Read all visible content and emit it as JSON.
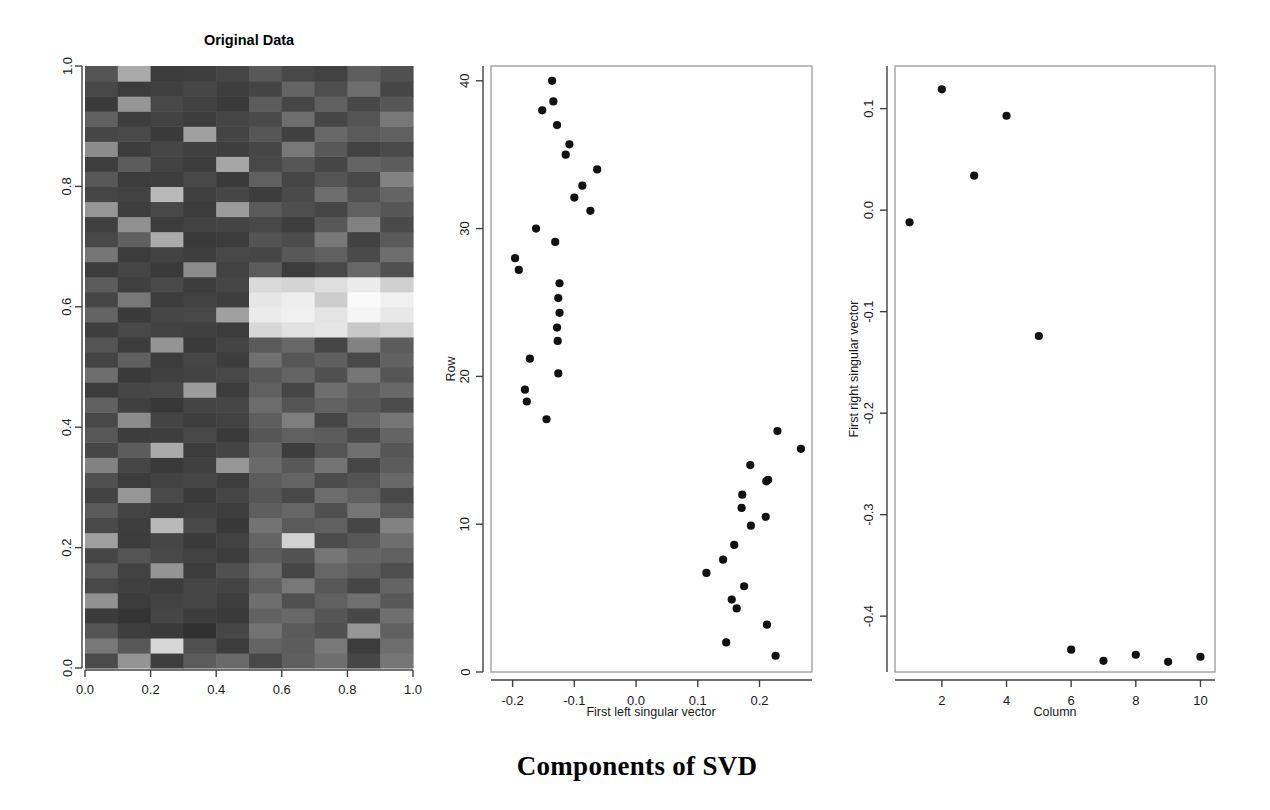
{
  "main_title": "Components of SVD",
  "panels": {
    "heatmap": {
      "title": "Original Data",
      "x_ticks": [
        "0.0",
        "0.2",
        "0.4",
        "0.6",
        "0.8",
        "1.0"
      ],
      "y_ticks": [
        "0.0",
        "0.2",
        "0.4",
        "0.6",
        "0.8",
        "1.0"
      ],
      "xlabel": "",
      "ylabel": ""
    },
    "left_vector": {
      "xlabel": "First left singular vector",
      "ylabel": "Row",
      "x_ticks": [
        "-0.2",
        "-0.1",
        "0.0",
        "0.1",
        "0.2"
      ],
      "y_ticks": [
        "0",
        "10",
        "20",
        "30",
        "40"
      ]
    },
    "right_vector": {
      "xlabel": "Column",
      "ylabel": "First right singular vector",
      "x_ticks": [
        "2",
        "4",
        "6",
        "8",
        "10"
      ],
      "y_ticks": [
        "-0.4",
        "-0.3",
        "-0.2",
        "-0.1",
        "0.0",
        "0.1"
      ]
    }
  },
  "colors": {
    "point": "#111111",
    "axis": "#404040",
    "box": "#9a9a9a",
    "background": "#ffffff"
  },
  "chart_data": [
    {
      "type": "heatmap",
      "title": "Original Data",
      "xlabel": "",
      "ylabel": "",
      "xlim": [
        0.0,
        1.0
      ],
      "ylim": [
        0.0,
        1.0
      ],
      "grid": false,
      "legend": "none",
      "ncols": 10,
      "nrows": 40,
      "colormap": "grayscale",
      "xtick_values": [
        0.0,
        0.2,
        0.4,
        0.6,
        0.8,
        1.0
      ],
      "ytick_values": [
        0.0,
        0.2,
        0.4,
        0.6,
        0.8,
        1.0
      ],
      "note": "Rows 1-40 (bottom to top), columns 1-10. Values are grayscale levels 0-255.",
      "matrix": [
        [
          75,
          148,
          62,
          92,
          105,
          72,
          95,
          110,
          70,
          118
        ],
        [
          120,
          88,
          215,
          80,
          60,
          100,
          92,
          120,
          60,
          110
        ],
        [
          84,
          62,
          58,
          48,
          70,
          115,
          90,
          80,
          150,
          96
        ],
        [
          60,
          52,
          70,
          62,
          58,
          98,
          104,
          86,
          72,
          112
        ],
        [
          145,
          60,
          66,
          70,
          62,
          110,
          80,
          96,
          112,
          88
        ],
        [
          72,
          64,
          60,
          70,
          68,
          95,
          120,
          88,
          70,
          100
        ],
        [
          92,
          66,
          148,
          60,
          80,
          108,
          70,
          102,
          92,
          78
        ],
        [
          70,
          84,
          72,
          66,
          60,
          92,
          82,
          118,
          100,
          96
        ],
        [
          160,
          60,
          70,
          58,
          66,
          100,
          210,
          75,
          88,
          110
        ],
        [
          74,
          62,
          185,
          72,
          56,
          115,
          90,
          96,
          70,
          130
        ],
        [
          90,
          68,
          60,
          64,
          62,
          94,
          102,
          80,
          118,
          90
        ],
        [
          66,
          150,
          74,
          58,
          70,
          86,
          72,
          108,
          96,
          72
        ],
        [
          80,
          60,
          66,
          70,
          62,
          92,
          100,
          76,
          84,
          104
        ],
        [
          130,
          70,
          58,
          64,
          150,
          106,
          88,
          116,
          70,
          92
        ],
        [
          70,
          92,
          170,
          60,
          68,
          98,
          60,
          84,
          112,
          86
        ],
        [
          88,
          60,
          62,
          72,
          58,
          86,
          96,
          92,
          74,
          100
        ],
        [
          72,
          140,
          68,
          62,
          66,
          94,
          126,
          70,
          100,
          118
        ],
        [
          96,
          64,
          56,
          68,
          70,
          108,
          84,
          98,
          88,
          76
        ],
        [
          60,
          70,
          72,
          155,
          60,
          96,
          70,
          110,
          92,
          104
        ],
        [
          110,
          58,
          64,
          66,
          72,
          88,
          100,
          80,
          118,
          86
        ],
        [
          68,
          96,
          60,
          70,
          62,
          112,
          86,
          96,
          72,
          98
        ],
        [
          84,
          60,
          148,
          58,
          68,
          90,
          104,
          70,
          130,
          92
        ],
        [
          62,
          72,
          66,
          64,
          60,
          215,
          225,
          230,
          200,
          210
        ],
        [
          100,
          58,
          70,
          72,
          160,
          235,
          240,
          228,
          245,
          232
        ],
        [
          70,
          120,
          60,
          66,
          62,
          230,
          238,
          205,
          250,
          240
        ],
        [
          92,
          64,
          74,
          60,
          70,
          218,
          212,
          222,
          235,
          208
        ],
        [
          60,
          70,
          58,
          140,
          66,
          92,
          60,
          72,
          104,
          80
        ],
        [
          118,
          60,
          66,
          62,
          72,
          70,
          88,
          96,
          74,
          110
        ],
        [
          72,
          96,
          170,
          58,
          60,
          84,
          76,
          120,
          66,
          90
        ],
        [
          64,
          145,
          60,
          66,
          68,
          72,
          62,
          88,
          130,
          74
        ],
        [
          150,
          62,
          72,
          60,
          155,
          90,
          78,
          70,
          96,
          86
        ],
        [
          70,
          66,
          185,
          64,
          70,
          60,
          74,
          110,
          82,
          100
        ],
        [
          88,
          60,
          62,
          72,
          58,
          96,
          70,
          84,
          72,
          130
        ],
        [
          62,
          92,
          66,
          60,
          165,
          72,
          86,
          70,
          100,
          92
        ],
        [
          140,
          60,
          70,
          64,
          62,
          70,
          120,
          88,
          66,
          74
        ],
        [
          70,
          74,
          58,
          160,
          68,
          86,
          64,
          104,
          90,
          96
        ],
        [
          96,
          62,
          66,
          60,
          70,
          74,
          110,
          70,
          84,
          120
        ],
        [
          60,
          150,
          72,
          66,
          58,
          92,
          70,
          96,
          72,
          86
        ],
        [
          72,
          60,
          64,
          70,
          62,
          68,
          100,
          78,
          110,
          70
        ],
        [
          84,
          170,
          60,
          62,
          70,
          88,
          72,
          66,
          94,
          80
        ]
      ]
    },
    {
      "type": "scatter",
      "title": "",
      "xlabel": "First left singular vector",
      "ylabel": "Row",
      "xlim": [
        -0.235,
        0.285
      ],
      "ylim": [
        0,
        41
      ],
      "grid": false,
      "legend": "none",
      "xtick_values": [
        -0.2,
        -0.1,
        0.0,
        0.1,
        0.2
      ],
      "ytick_values": [
        0,
        10,
        20,
        30,
        40
      ],
      "points": [
        {
          "x": -0.136,
          "y": 40.0
        },
        {
          "x": -0.134,
          "y": 38.6
        },
        {
          "x": -0.152,
          "y": 38.0
        },
        {
          "x": -0.128,
          "y": 37.0
        },
        {
          "x": -0.108,
          "y": 35.7
        },
        {
          "x": -0.114,
          "y": 35.0
        },
        {
          "x": -0.063,
          "y": 34.0
        },
        {
          "x": -0.087,
          "y": 32.9
        },
        {
          "x": -0.1,
          "y": 32.1
        },
        {
          "x": -0.074,
          "y": 31.2
        },
        {
          "x": -0.162,
          "y": 30.0
        },
        {
          "x": -0.131,
          "y": 29.1
        },
        {
          "x": -0.196,
          "y": 28.0
        },
        {
          "x": -0.19,
          "y": 27.2
        },
        {
          "x": -0.124,
          "y": 26.3
        },
        {
          "x": -0.126,
          "y": 25.3
        },
        {
          "x": -0.124,
          "y": 24.3
        },
        {
          "x": -0.128,
          "y": 23.3
        },
        {
          "x": -0.127,
          "y": 22.4
        },
        {
          "x": -0.172,
          "y": 21.2
        },
        {
          "x": -0.126,
          "y": 20.2
        },
        {
          "x": -0.18,
          "y": 19.1
        },
        {
          "x": -0.177,
          "y": 18.3
        },
        {
          "x": -0.145,
          "y": 17.1
        },
        {
          "x": 0.229,
          "y": 16.3
        },
        {
          "x": 0.267,
          "y": 15.1
        },
        {
          "x": 0.185,
          "y": 14.0
        },
        {
          "x": 0.211,
          "y": 12.9
        },
        {
          "x": 0.172,
          "y": 12.0
        },
        {
          "x": 0.171,
          "y": 11.1
        },
        {
          "x": 0.21,
          "y": 10.5
        },
        {
          "x": 0.214,
          "y": 13.0
        },
        {
          "x": 0.186,
          "y": 9.9
        },
        {
          "x": 0.159,
          "y": 8.6
        },
        {
          "x": 0.141,
          "y": 7.6
        },
        {
          "x": 0.114,
          "y": 6.7
        },
        {
          "x": 0.175,
          "y": 5.8
        },
        {
          "x": 0.155,
          "y": 4.9
        },
        {
          "x": 0.163,
          "y": 4.3
        },
        {
          "x": 0.212,
          "y": 3.2
        },
        {
          "x": 0.146,
          "y": 2.0
        },
        {
          "x": 0.226,
          "y": 1.1
        }
      ]
    },
    {
      "type": "scatter",
      "title": "",
      "xlabel": "Column",
      "ylabel": "First right singular vector",
      "xlim": [
        0.55,
        10.45
      ],
      "ylim": [
        -0.455,
        0.142
      ],
      "grid": false,
      "legend": "none",
      "xtick_values": [
        2,
        4,
        6,
        8,
        10
      ],
      "ytick_values": [
        -0.4,
        -0.3,
        -0.2,
        -0.1,
        0.0,
        0.1
      ],
      "points": [
        {
          "x": 1,
          "y": -0.012
        },
        {
          "x": 2,
          "y": 0.119
        },
        {
          "x": 3,
          "y": 0.034
        },
        {
          "x": 4,
          "y": 0.093
        },
        {
          "x": 5,
          "y": -0.124
        },
        {
          "x": 6,
          "y": -0.433
        },
        {
          "x": 7,
          "y": -0.444
        },
        {
          "x": 8,
          "y": -0.438
        },
        {
          "x": 9,
          "y": -0.445
        },
        {
          "x": 10,
          "y": -0.44
        }
      ]
    }
  ]
}
